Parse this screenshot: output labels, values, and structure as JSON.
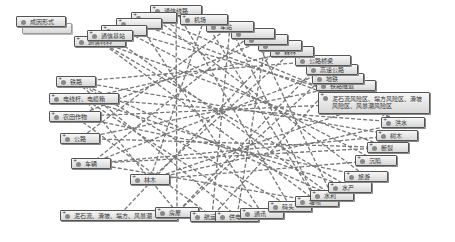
{
  "diagram": {
    "legend_node": {
      "label": "成因形式",
      "x": 16,
      "y": 16,
      "w": 50
    },
    "nodes": [
      {
        "id": "n1",
        "label": "通信线路",
        "x": 150,
        "y": 5,
        "w": 52
      },
      {
        "id": "n2",
        "label": "",
        "x": 131,
        "y": 12,
        "w": 46
      },
      {
        "id": "n3",
        "label": "",
        "x": 116,
        "y": 18,
        "w": 46
      },
      {
        "id": "n4",
        "label": "",
        "x": 101,
        "y": 25,
        "w": 46
      },
      {
        "id": "n5",
        "label": "通信材料",
        "x": 74,
        "y": 36,
        "w": 52
      },
      {
        "id": "n6",
        "label": "通信基站",
        "x": 87,
        "y": 30,
        "w": 46
      },
      {
        "id": "n7",
        "label": "铁路",
        "x": 56,
        "y": 76,
        "w": 40
      },
      {
        "id": "n8",
        "label": "电线杆、电缆箱",
        "x": 49,
        "y": 93,
        "w": 70
      },
      {
        "id": "n9",
        "label": "农田作物",
        "x": 49,
        "y": 111,
        "w": 52
      },
      {
        "id": "n10",
        "label": "公路",
        "x": 60,
        "y": 133,
        "w": 40
      },
      {
        "id": "n11",
        "label": "车辆",
        "x": 71,
        "y": 158,
        "w": 40
      },
      {
        "id": "n12",
        "label": "林木",
        "x": 130,
        "y": 174,
        "w": 40
      },
      {
        "id": "n13",
        "label": "泥石流、滑坡、塌方、风暴潮",
        "x": 60,
        "y": 210,
        "w": 118
      },
      {
        "id": "n14",
        "label": "房屋",
        "x": 155,
        "y": 207,
        "w": 44
      },
      {
        "id": "n15",
        "label": "航运",
        "x": 190,
        "y": 211,
        "w": 44
      },
      {
        "id": "n16",
        "label": "供电",
        "x": 215,
        "y": 211,
        "w": 44
      },
      {
        "id": "n17",
        "label": "通讯",
        "x": 240,
        "y": 208,
        "w": 44
      },
      {
        "id": "n18",
        "label": "码头",
        "x": 268,
        "y": 201,
        "w": 44
      },
      {
        "id": "n19",
        "label": "堤坝",
        "x": 295,
        "y": 196,
        "w": 44
      },
      {
        "id": "n20",
        "label": "水利",
        "x": 310,
        "y": 190,
        "w": 44
      },
      {
        "id": "n21",
        "label": "水产",
        "x": 328,
        "y": 182,
        "w": 44
      },
      {
        "id": "n22",
        "label": "旅游",
        "x": 344,
        "y": 171,
        "w": 44
      },
      {
        "id": "n23",
        "label": "沉陷",
        "x": 355,
        "y": 155,
        "w": 42
      },
      {
        "id": "n24",
        "label": "断裂",
        "x": 367,
        "y": 142,
        "w": 42
      },
      {
        "id": "n25",
        "label": "树木",
        "x": 376,
        "y": 130,
        "w": 42
      },
      {
        "id": "n26",
        "label": "洪水",
        "x": 381,
        "y": 117,
        "w": 44
      },
      {
        "id": "n27",
        "label": "泥石流风险区、塌方风险区、滑坡风险区、风暴潮风险区",
        "x": 318,
        "y": 92,
        "w": 112,
        "tall": true
      },
      {
        "id": "n28",
        "label": "铁路隧道",
        "x": 316,
        "y": 80,
        "w": 60
      },
      {
        "id": "n29",
        "label": "地铁",
        "x": 312,
        "y": 73,
        "w": 52
      },
      {
        "id": "n30",
        "label": "高速公路",
        "x": 306,
        "y": 64,
        "w": 52
      },
      {
        "id": "n31",
        "label": "公路桥梁",
        "x": 295,
        "y": 55,
        "w": 56
      },
      {
        "id": "n32",
        "label": "森林",
        "x": 270,
        "y": 46,
        "w": 44
      },
      {
        "id": "n33",
        "label": "",
        "x": 258,
        "y": 40,
        "w": 44
      },
      {
        "id": "n34",
        "label": "",
        "x": 244,
        "y": 34,
        "w": 44
      },
      {
        "id": "n35",
        "label": "",
        "x": 231,
        "y": 28,
        "w": 44
      },
      {
        "id": "n36",
        "label": "车站",
        "x": 206,
        "y": 21,
        "w": 48
      },
      {
        "id": "n37",
        "label": "机场",
        "x": 180,
        "y": 14,
        "w": 48
      }
    ],
    "edges": [
      [
        "n5",
        "n21"
      ],
      [
        "n5",
        "n24"
      ],
      [
        "n5",
        "n19"
      ],
      [
        "n6",
        "n20"
      ],
      [
        "n4",
        "n23"
      ],
      [
        "n3",
        "n17"
      ],
      [
        "n2",
        "n26"
      ],
      [
        "n1",
        "n18"
      ],
      [
        "n1",
        "n14"
      ],
      [
        "n37",
        "n12"
      ],
      [
        "n37",
        "n19"
      ],
      [
        "n36",
        "n15"
      ],
      [
        "n36",
        "n10"
      ],
      [
        "n35",
        "n11"
      ],
      [
        "n35",
        "n20"
      ],
      [
        "n34",
        "n16"
      ],
      [
        "n34",
        "n9"
      ],
      [
        "n33",
        "n13"
      ],
      [
        "n32",
        "n12"
      ],
      [
        "n32",
        "n8"
      ],
      [
        "n31",
        "n14"
      ],
      [
        "n31",
        "n7"
      ],
      [
        "n30",
        "n11"
      ],
      [
        "n29",
        "n15"
      ],
      [
        "n28",
        "n10"
      ],
      [
        "n27",
        "n9"
      ],
      [
        "n27",
        "n12"
      ],
      [
        "n26",
        "n8"
      ],
      [
        "n25",
        "n7"
      ],
      [
        "n25",
        "n11"
      ],
      [
        "n24",
        "n10"
      ],
      [
        "n23",
        "n12"
      ],
      [
        "n22",
        "n9"
      ],
      [
        "n21",
        "n8"
      ],
      [
        "n20",
        "n7"
      ],
      [
        "n19",
        "n11"
      ],
      [
        "n18",
        "n7"
      ],
      [
        "n17",
        "n8"
      ],
      [
        "n16",
        "n7"
      ],
      [
        "n15",
        "n9"
      ],
      [
        "n14",
        "n8"
      ],
      [
        "n24",
        "n11"
      ],
      [
        "n26",
        "n12"
      ],
      [
        "n30",
        "n14"
      ],
      [
        "n36",
        "n19"
      ],
      [
        "n2",
        "n22"
      ],
      [
        "n4",
        "n27"
      ],
      [
        "n3",
        "n26"
      ]
    ],
    "edge_color": "#777777"
  }
}
